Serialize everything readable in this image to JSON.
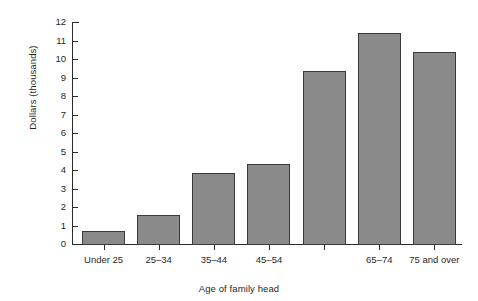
{
  "chart_data": {
    "type": "bar",
    "title": "",
    "xlabel": "Age of family head",
    "ylabel": "Dollars (thousands)",
    "categories": [
      "Under 25",
      "25–34",
      "35–44",
      "45–54",
      "",
      "65–74",
      "75 and over"
    ],
    "values": [
      0.7,
      1.55,
      3.85,
      4.3,
      9.35,
      11.4,
      10.4
    ],
    "ylim": [
      0,
      12
    ],
    "yticks": [
      0,
      1,
      2,
      3,
      4,
      5,
      6,
      7,
      8,
      9,
      10,
      11,
      12
    ],
    "ytick_labels": [
      "0",
      "1",
      "2",
      "3",
      "4",
      "5",
      "6",
      "7",
      "8",
      "9",
      "10",
      "11",
      "12"
    ],
    "grid": false,
    "legend": null,
    "bar_color": "#8a8a8a",
    "bar_edge_color": "#3a3a3a",
    "axis_color": "#2b2b2b",
    "background": "#ffffff"
  }
}
